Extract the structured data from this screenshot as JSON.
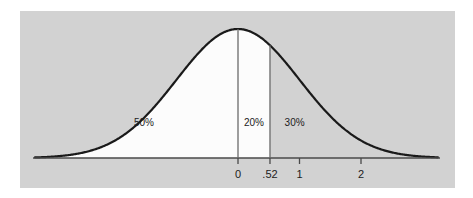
{
  "figure": {
    "panel_background_color": "#d2d2d2",
    "page_background_color": "#ffffff",
    "curve_color": "#1a1a1a",
    "fill_color": "#fcfcfc",
    "axis_color": "#4a4a4a",
    "divider_color": "#6a6a6a",
    "text_color": "#1c1c1c"
  },
  "chart_data": {
    "type": "area",
    "title": "",
    "subtitle": "",
    "xlabel": "",
    "ylabel": "",
    "grid": false,
    "legend": "none",
    "distribution": "standard normal",
    "mean": 0,
    "sd": 1,
    "xlim": [
      -3.3,
      3.25
    ],
    "ylim": [
      0,
      0.4
    ],
    "x_tick_values": [
      0,
      0.52,
      1,
      2
    ],
    "x_tick_labels": [
      "0",
      ".52",
      "1",
      "2"
    ],
    "vertical_lines": [
      {
        "name": "mean-line",
        "z": 0
      },
      {
        "name": "z-score-line",
        "z": 0.52
      }
    ],
    "shaded_regions": [
      {
        "name": "left-of-mean",
        "from": -3.3,
        "to": 0,
        "label": "50%",
        "value": 50,
        "filled": true
      },
      {
        "name": "mean-to-z",
        "from": 0,
        "to": 0.52,
        "label": "20%",
        "value": 20,
        "filled": true
      },
      {
        "name": "right-of-z",
        "from": 0.52,
        "to": 3.25,
        "label": "30%",
        "value": 30,
        "filled": false
      }
    ],
    "region_labels": [
      "50%",
      "20%",
      "30%"
    ],
    "region_values": [
      50,
      20,
      30
    ]
  },
  "axis": {
    "ticks": [
      {
        "label": "0",
        "z": 0
      },
      {
        "label": ".52",
        "z": 0.52
      },
      {
        "label": "1",
        "z": 1
      },
      {
        "label": "2",
        "z": 2
      }
    ]
  },
  "regions": {
    "left": {
      "label": "50%"
    },
    "middle": {
      "label": "20%"
    },
    "right": {
      "label": "30%"
    }
  }
}
